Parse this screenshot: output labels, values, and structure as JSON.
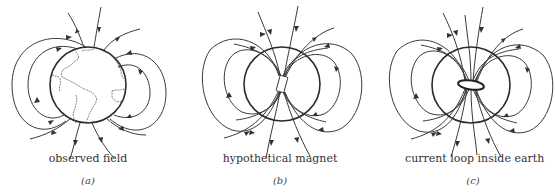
{
  "figure": {
    "panels": [
      {
        "id": "a",
        "caption": "observed field",
        "letter": "(a)",
        "subject": "earth-globe"
      },
      {
        "id": "b",
        "caption": "hypothetical magnet",
        "letter": "(b)",
        "subject": "bar-magnet"
      },
      {
        "id": "c",
        "caption": "current loop inside earth",
        "letter": "(c)",
        "subject": "current-loop"
      }
    ],
    "stroke_color": "#333333",
    "background": "#ffffff"
  }
}
